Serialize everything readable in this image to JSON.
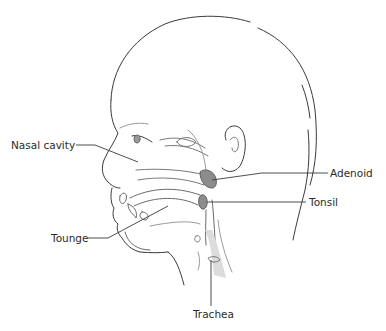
{
  "diagram": {
    "labels": {
      "nasal_cavity": "Nasal cavity",
      "adenoid": "Adenoid",
      "tonsil": "Tonsil",
      "tounge": "Tounge",
      "trachea": "Trachea"
    },
    "colors": {
      "line": "#3a3a3a",
      "light_line": "#9a9a9a",
      "organ_fill": "#8c8c8c",
      "airway_fill": "#dcdcdc",
      "background": "#ffffff"
    }
  }
}
